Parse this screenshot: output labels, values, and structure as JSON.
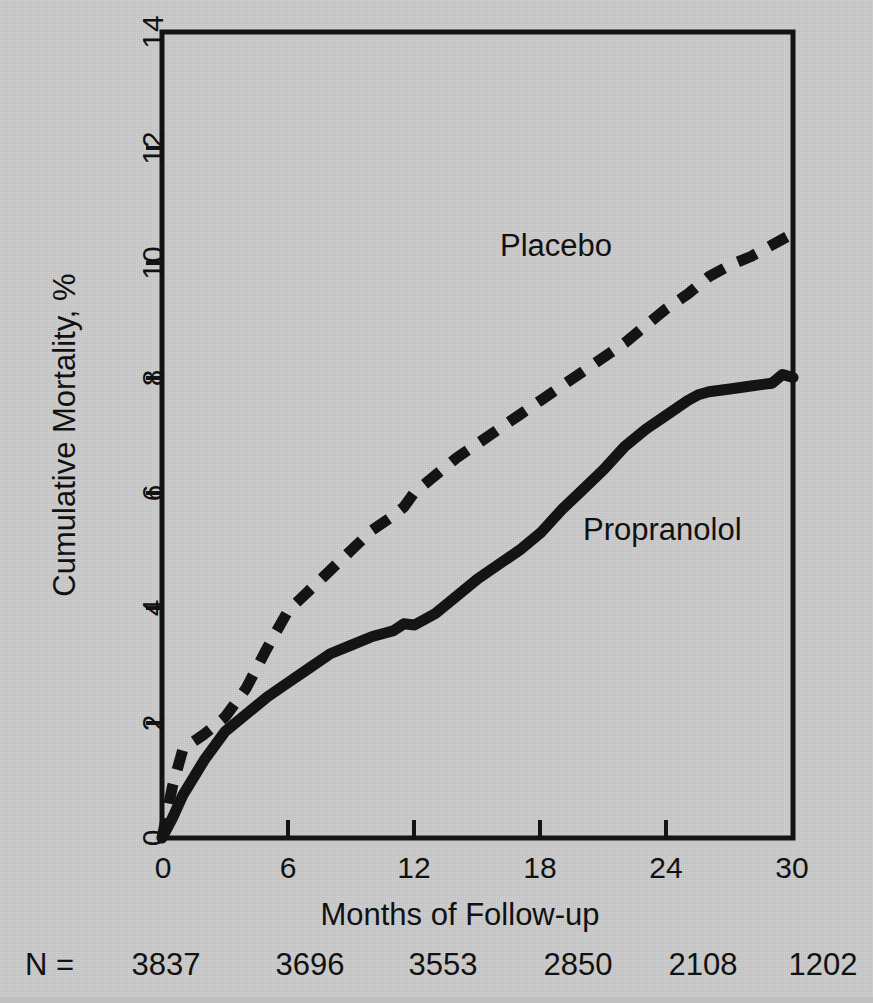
{
  "chart_data": {
    "type": "line",
    "title": "",
    "xlabel": "Months of Follow-up",
    "ylabel": "Cumulative Mortality, %",
    "xlim": [
      0,
      30
    ],
    "ylim": [
      0,
      14
    ],
    "xticks": [
      "0",
      "6",
      "12",
      "18",
      "24",
      "30"
    ],
    "yticks": [
      "0",
      "2",
      "4",
      "6",
      "8",
      "10",
      "12",
      "14"
    ],
    "grid": false,
    "legend_position": "inline-annotation",
    "series": [
      {
        "name": "Placebo",
        "style": "dashed",
        "color": "#141414",
        "x": [
          0,
          0.5,
          1,
          2,
          3,
          4,
          5,
          6,
          7,
          8,
          9,
          10,
          11,
          11.5,
          12,
          13,
          14,
          15,
          16,
          17,
          18,
          19,
          20,
          21,
          22,
          23,
          24,
          25,
          26,
          27,
          28,
          29,
          30
        ],
        "y": [
          0,
          0.9,
          1.55,
          1.8,
          2.1,
          2.6,
          3.3,
          3.95,
          4.3,
          4.65,
          5.0,
          5.35,
          5.6,
          5.75,
          6.0,
          6.3,
          6.6,
          6.85,
          7.1,
          7.35,
          7.6,
          7.85,
          8.1,
          8.35,
          8.6,
          8.9,
          9.2,
          9.45,
          9.75,
          9.95,
          10.1,
          10.3,
          10.5
        ]
      },
      {
        "name": "Propranolol",
        "style": "solid",
        "color": "#141414",
        "x": [
          0,
          0.5,
          1,
          2,
          3,
          4,
          5,
          6,
          7,
          8,
          9,
          10,
          11,
          11.5,
          12,
          13,
          14,
          15,
          16,
          17,
          18,
          19,
          20,
          21,
          22,
          23,
          24,
          25,
          25.5,
          26,
          27,
          28,
          29,
          29.5,
          30
        ],
        "y": [
          0,
          0.35,
          0.75,
          1.35,
          1.85,
          2.15,
          2.45,
          2.7,
          2.95,
          3.2,
          3.35,
          3.5,
          3.6,
          3.72,
          3.7,
          3.9,
          4.2,
          4.5,
          4.75,
          5.0,
          5.3,
          5.7,
          6.05,
          6.4,
          6.8,
          7.1,
          7.35,
          7.6,
          7.7,
          7.75,
          7.8,
          7.85,
          7.9,
          8.05,
          8.0
        ]
      }
    ],
    "annotations": [
      {
        "text": "Placebo",
        "x_px": 500,
        "y_px": 256
      },
      {
        "text": "Propranolol",
        "x_px": 583,
        "y_px": 540
      }
    ],
    "n_row": {
      "prefix": "N =",
      "values": [
        "3837",
        "3696",
        "3553",
        "2850",
        "2108",
        "1202"
      ]
    }
  }
}
